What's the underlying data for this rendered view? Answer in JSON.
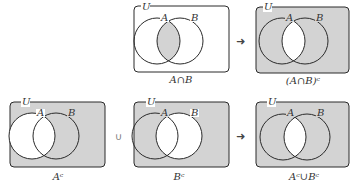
{
  "colors": {
    "shade": "#d3d3d3",
    "stroke": "#2a2a2a",
    "background": "#ffffff"
  },
  "symbols": {
    "arrow": "➜",
    "union": "∪"
  },
  "panels": [
    {
      "id": "a-intersect-b",
      "universe_label": "U",
      "set_a_label": "A",
      "set_b_label": "B",
      "caption": "A∩B",
      "shaded": "intersection"
    },
    {
      "id": "complement-of-a-intersect-b",
      "universe_label": "U",
      "set_a_label": "A",
      "set_b_label": "B",
      "caption": "(A∩B)ᶜ",
      "shaded": "all-except-intersection"
    },
    {
      "id": "a-complement",
      "universe_label": "U",
      "set_a_label": "A",
      "set_b_label": "B",
      "caption": "Aᶜ",
      "shaded": "outside-A"
    },
    {
      "id": "b-complement",
      "universe_label": "U",
      "set_a_label": "A",
      "set_b_label": "B",
      "caption": "Bᶜ",
      "shaded": "outside-B"
    },
    {
      "id": "a-complement-union-b-complement",
      "universe_label": "U",
      "set_a_label": "A",
      "set_b_label": "B",
      "caption": "Aᶜ∪Bᶜ",
      "shaded": "all-except-intersection"
    }
  ]
}
